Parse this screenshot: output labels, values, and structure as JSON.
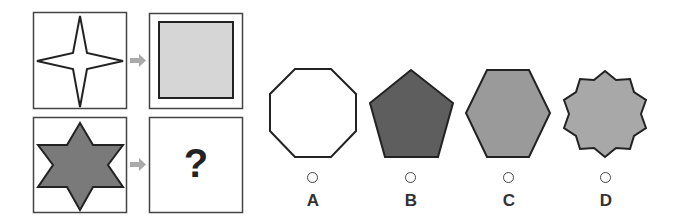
{
  "puzzle": {
    "example_pair": {
      "source_shape": "four-pointed-star",
      "source_fill": "#ffffff",
      "target_shape": "square",
      "target_fill": "#d6d6d6"
    },
    "question_pair": {
      "source_shape": "six-pointed-star",
      "source_fill": "#7a7a7a",
      "target": "?"
    },
    "arrow_color": "#aaaaaa"
  },
  "options": [
    {
      "label": "A",
      "shape": "octagon",
      "fill": "#ffffff"
    },
    {
      "label": "B",
      "shape": "pentagon",
      "fill": "#5e5e5e"
    },
    {
      "label": "C",
      "shape": "hexagon",
      "fill": "#9a9a9a"
    },
    {
      "label": "D",
      "shape": "ten-pointed-star",
      "fill": "#a8a8a8"
    }
  ]
}
